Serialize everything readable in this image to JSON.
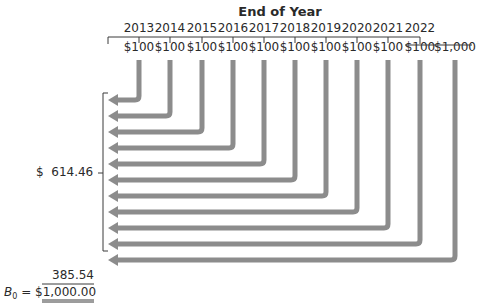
{
  "diagram": {
    "title": "End of Year",
    "years": [
      "2013",
      "2014",
      "2015",
      "2016",
      "2017",
      "2018",
      "2019",
      "2020",
      "2021",
      "2022"
    ],
    "cash_flows": [
      "$100",
      "$100",
      "$100",
      "$100",
      "$100",
      "$100",
      "$100",
      "$100",
      "$100",
      "$100",
      "$1,000"
    ],
    "pv_coupons_label": "$  614.46",
    "pv_principal_label": "385.54",
    "bond_value_symbol": "B",
    "bond_value_subscript": "0",
    "bond_value_equals": " = ",
    "bond_value": "$1,000.00",
    "arrow_color": "#8c8c8c",
    "line_color": "#3a3a3a"
  }
}
